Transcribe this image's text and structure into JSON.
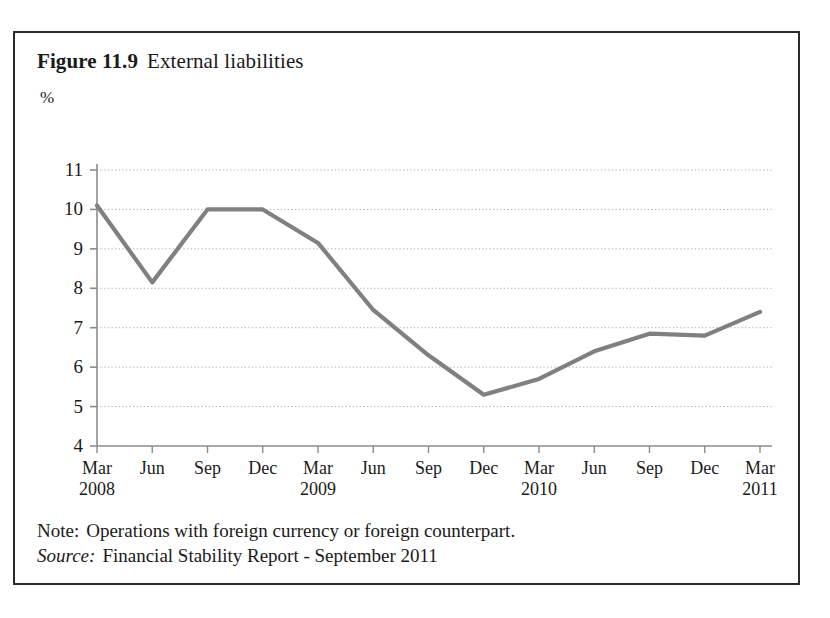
{
  "figure": {
    "label": "Figure 11.9",
    "name": "External liabilities"
  },
  "footer": {
    "note_lead": "Note:",
    "note_text": "Operations with foreign currency or foreign counterpart.",
    "source_lead": "Source:",
    "source_text": "Financial Stability Report - September 2011"
  },
  "chart_data": {
    "type": "line",
    "title": "External liabilities",
    "xlabel": "",
    "ylabel": "%",
    "unit": "%",
    "grid": true,
    "legend": "none",
    "line_color": "#808080",
    "grid_color": "#b4b4b4",
    "axis_color": "#8c8c8c",
    "ylim": [
      4,
      11
    ],
    "yticks": [
      11,
      10,
      9,
      8,
      7,
      6,
      5,
      4
    ],
    "categories": [
      "Mar 2008",
      "Jun 2008",
      "Sep 2008",
      "Dec 2008",
      "Mar 2009",
      "Jun 2009",
      "Sep 2009",
      "Dec 2009",
      "Mar 2010",
      "Jun 2010",
      "Sep 2010",
      "Dec 2010",
      "Mar 2011"
    ],
    "xtick_months": [
      "Mar",
      "Jun",
      "Sep",
      "Dec",
      "Mar",
      "Jun",
      "Sep",
      "Dec",
      "Mar",
      "Jun",
      "Sep",
      "Dec",
      "Mar"
    ],
    "xtick_years": [
      "2008",
      "",
      "",
      "",
      "2009",
      "",
      "",
      "",
      "2010",
      "",
      "",
      "",
      "2011"
    ],
    "values": [
      10.1,
      8.15,
      10.0,
      10.0,
      9.15,
      7.45,
      6.3,
      5.3,
      5.7,
      6.4,
      6.85,
      6.8,
      7.4
    ]
  }
}
